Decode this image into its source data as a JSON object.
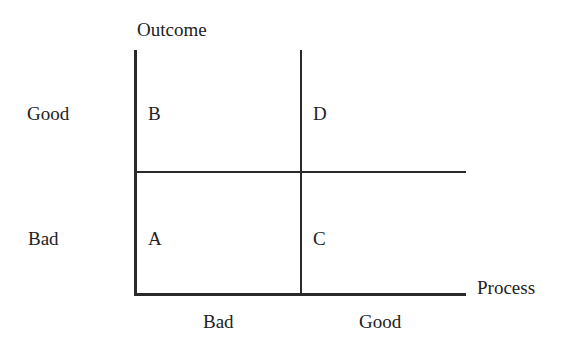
{
  "diagram": {
    "y_axis": {
      "title": "Outcome",
      "ticks": [
        "Good",
        "Bad"
      ]
    },
    "x_axis": {
      "title": "Process",
      "ticks": [
        "Bad",
        "Good"
      ]
    },
    "quadrants": {
      "top_left": "B",
      "top_right": "D",
      "bottom_left": "A",
      "bottom_right": "C"
    }
  }
}
